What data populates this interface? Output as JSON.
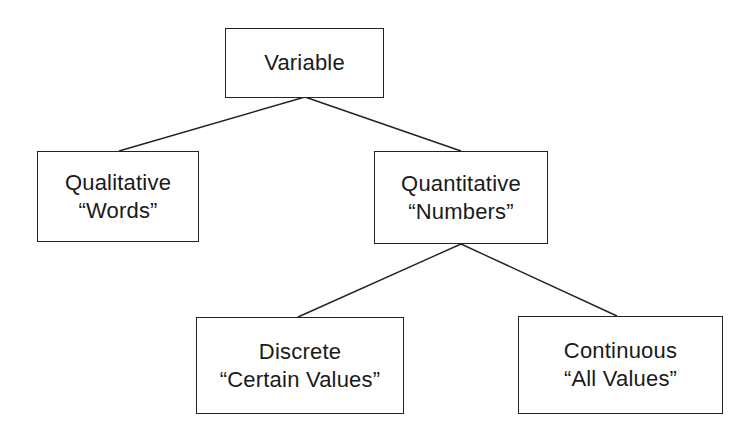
{
  "diagram": {
    "type": "tree",
    "nodes": {
      "variable": {
        "title": "Variable"
      },
      "qualitative": {
        "title": "Qualitative",
        "subtitle": "“Words”"
      },
      "quantitative": {
        "title": "Quantitative",
        "subtitle": "“Numbers”"
      },
      "discrete": {
        "title": "Discrete",
        "subtitle": "“Certain Values”"
      },
      "continuous": {
        "title": "Continuous",
        "subtitle": "“All Values”"
      }
    },
    "edges": [
      {
        "from": "variable",
        "to": "qualitative"
      },
      {
        "from": "variable",
        "to": "quantitative"
      },
      {
        "from": "quantitative",
        "to": "discrete"
      },
      {
        "from": "quantitative",
        "to": "continuous"
      }
    ],
    "colors": {
      "stroke": "#222222",
      "background": "#ffffff",
      "text": "#1a1a1a"
    }
  }
}
